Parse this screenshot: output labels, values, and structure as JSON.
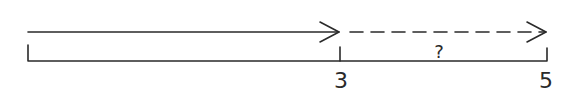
{
  "diagram": {
    "type": "number-line-arrows",
    "stroke_color": "#2a2a2a",
    "background": "#ffffff",
    "solid_arrow": {
      "from": 0,
      "to": 3,
      "style": "solid"
    },
    "dashed_arrow": {
      "from": 3,
      "to": 5,
      "style": "dashed"
    },
    "segment_label": "?",
    "tick_labels": {
      "three": "3",
      "five": "5"
    }
  }
}
